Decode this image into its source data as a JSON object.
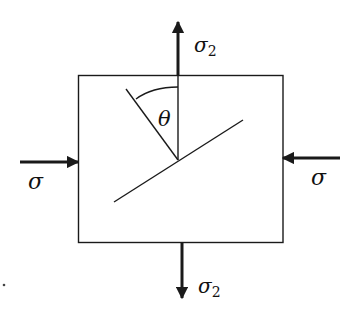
{
  "diagram": {
    "title": "",
    "colors": {
      "ink": "#1a1a1a",
      "background": "#ffffff"
    },
    "specimen_box": {
      "x": 78,
      "y": 75,
      "width": 205,
      "height": 168
    },
    "labels": {
      "top_stress": {
        "symbol": "σ",
        "subscript": "2"
      },
      "bottom_stress": {
        "symbol": "σ",
        "subscript": "2"
      },
      "left_stress": {
        "symbol": "σ"
      },
      "right_stress": {
        "symbol": "σ"
      },
      "angle": "θ"
    },
    "arrows": [
      {
        "name": "top-tension-arrow",
        "direction": "up",
        "from": [
          178,
          75
        ],
        "to": [
          178,
          22
        ]
      },
      {
        "name": "bottom-tension-arrow",
        "direction": "down",
        "from": [
          182,
          243
        ],
        "to": [
          182,
          298
        ]
      },
      {
        "name": "left-compression-arrow",
        "direction": "right",
        "from": [
          20,
          162
        ],
        "to": [
          78,
          162
        ]
      },
      {
        "name": "right-compression-arrow",
        "direction": "left",
        "from": [
          340,
          158
        ],
        "to": [
          283,
          158
        ]
      }
    ],
    "interior": {
      "vertical_reference_line": {
        "from": [
          178,
          75
        ],
        "to": [
          178,
          160
        ]
      },
      "plane_normal_line": {
        "from": [
          126,
          89
        ],
        "to": [
          178,
          160
        ]
      },
      "inclined_plane_line": {
        "from": [
          114,
          202
        ],
        "to": [
          243,
          120
        ]
      },
      "angle_arc": {
        "from": [
          136,
          99
        ],
        "to": [
          178,
          87
        ]
      }
    }
  }
}
